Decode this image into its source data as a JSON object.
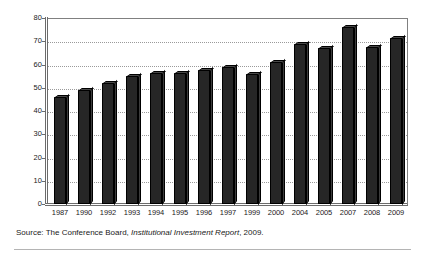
{
  "chart_data": {
    "type": "bar",
    "title": "",
    "subtitle": "",
    "xlabel": "",
    "ylabel": "",
    "categories": [
      "1987",
      "1990",
      "1992",
      "1993",
      "1994",
      "1995",
      "1996",
      "1997",
      "1999",
      "2000",
      "2004",
      "2005",
      "2007",
      "2008",
      "2009"
    ],
    "values": [
      46,
      49,
      52,
      55,
      56.5,
      56.5,
      57.5,
      59,
      56,
      61,
      69,
      67,
      76,
      67.5,
      71.5
    ],
    "ylim": [
      0,
      80
    ],
    "yticks": [
      0,
      10,
      20,
      30,
      40,
      50,
      60,
      70,
      80
    ],
    "ytick_labels": [
      "0",
      "10",
      "20",
      "30",
      "40",
      "50",
      "60",
      "70",
      "80"
    ],
    "grid": true,
    "grid_style": "dotted-horizontal",
    "legend": "none",
    "bar_color": "#262626",
    "bar_style": "3d-extruded",
    "axis_color": "#6b6b6b",
    "gridline_color": "#9a9a9a"
  },
  "source": {
    "prefix": "Source:",
    "publisher": "The Conference Board,",
    "report_title": "Institutional Investment Report",
    "year": ", 2009."
  }
}
